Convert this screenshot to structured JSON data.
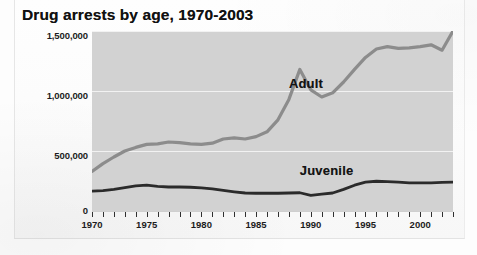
{
  "chart_data": {
    "type": "line",
    "title": "Drug arrests by age, 1970-2003",
    "xlabel": "",
    "ylabel": "",
    "xlim": [
      1970,
      2003
    ],
    "ylim": [
      0,
      1500000
    ],
    "grid": true,
    "legend_position": "inline-annotation",
    "y_ticks": [
      0,
      500000,
      1000000,
      1500000
    ],
    "y_tick_labels": [
      "0",
      "500,000",
      "1,000,000",
      "1,500,000"
    ],
    "x_ticks": [
      1970,
      1975,
      1980,
      1985,
      1990,
      1995,
      2000
    ],
    "x_tick_labels": [
      "1970",
      "1975",
      "1980",
      "1985",
      "1990",
      "1995",
      "2000"
    ],
    "x_minor_tick_interval": 1,
    "x": [
      1970,
      1971,
      1972,
      1973,
      1974,
      1975,
      1976,
      1977,
      1978,
      1979,
      1980,
      1981,
      1982,
      1983,
      1984,
      1985,
      1986,
      1987,
      1988,
      1989,
      1990,
      1991,
      1992,
      1993,
      1994,
      1995,
      1996,
      1997,
      1998,
      1999,
      2000,
      2001,
      2002,
      2003
    ],
    "series": [
      {
        "name": "Adult",
        "color": "#8c8c8c",
        "values": [
          330000,
          395000,
          450000,
          500000,
          530000,
          555000,
          560000,
          575000,
          570000,
          560000,
          555000,
          565000,
          600000,
          610000,
          600000,
          620000,
          660000,
          760000,
          930000,
          1180000,
          1010000,
          950000,
          985000,
          1075000,
          1180000,
          1280000,
          1350000,
          1370000,
          1355000,
          1360000,
          1370000,
          1385000,
          1340000,
          1500000
        ]
      },
      {
        "name": "Juvenile",
        "color": "#2b2b2b",
        "values": [
          165000,
          170000,
          180000,
          195000,
          210000,
          215000,
          205000,
          200000,
          200000,
          198000,
          192000,
          185000,
          172000,
          160000,
          150000,
          148000,
          148000,
          148000,
          150000,
          152000,
          130000,
          140000,
          150000,
          180000,
          215000,
          240000,
          248000,
          245000,
          240000,
          235000,
          235000,
          235000,
          238000,
          240000
        ]
      }
    ],
    "annotations": [
      {
        "text": "Adult",
        "x": 1988,
        "y": 1060000
      },
      {
        "text": "Juvenile",
        "x": 1989,
        "y": 330000
      }
    ]
  },
  "colors": {
    "plot_background": "#d2d2d2",
    "gridline": "#f2f2f2",
    "page_background": "#fdfdfd",
    "title_text": "#111111",
    "axis_text": "#1c1c1c"
  }
}
